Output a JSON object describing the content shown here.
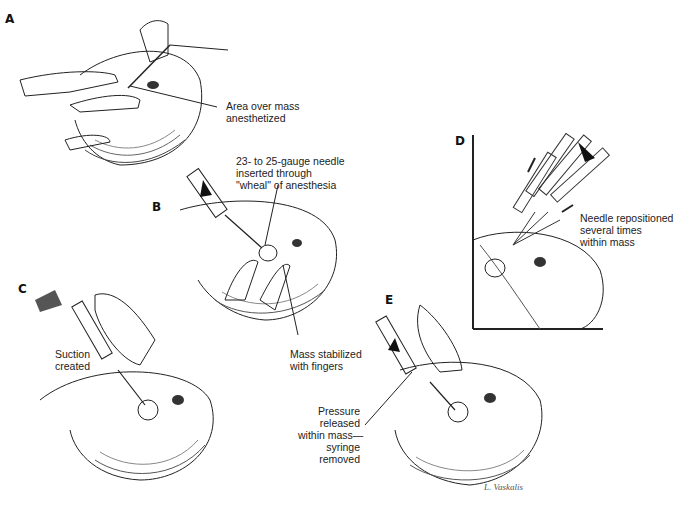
{
  "figure": {
    "signature": "L. Vaskalis",
    "panels": [
      {
        "id": "A",
        "letter": "A",
        "labels": [
          {
            "text": "Area over mass\nanesthetized"
          }
        ]
      },
      {
        "id": "B",
        "letter": "B",
        "labels": [
          {
            "text": "23- to 25-gauge needle\ninserted through\n\"wheal\" of anesthesia"
          },
          {
            "text": "Mass stabilized\nwith fingers"
          }
        ]
      },
      {
        "id": "C",
        "letter": "C",
        "labels": [
          {
            "text": "Suction\ncreated"
          }
        ]
      },
      {
        "id": "D",
        "letter": "D",
        "labels": [
          {
            "text": "Needle repositioned\nseveral times\nwithin mass"
          }
        ]
      },
      {
        "id": "E",
        "letter": "E",
        "labels": [
          {
            "text": "Pressure\nreleased\nwithin mass—\nsyringe\nremoved"
          }
        ]
      }
    ]
  }
}
